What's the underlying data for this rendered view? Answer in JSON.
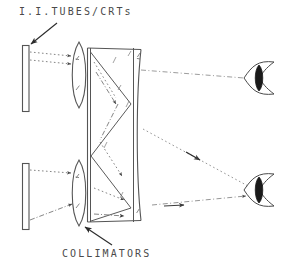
{
  "figure": {
    "title": "I.I.TUBES/CRTs",
    "caption": "COLLIMATORS",
    "width": 294,
    "height": 272,
    "background_color": "#ffffff",
    "ink_color": "#4a4a4a",
    "dark_ink_color": "#2b2b2b"
  },
  "labels": {
    "tubes": "I.I.TUBES/CRTs",
    "collimators": "COLLIMATORS"
  },
  "components": {
    "sources": [
      {
        "name": "upper-ii-tube",
        "x": 22,
        "y": 45,
        "width": 7,
        "height": 67
      },
      {
        "name": "lower-ii-tube",
        "x": 22,
        "y": 163,
        "width": 7,
        "height": 67
      }
    ],
    "collimators": [
      {
        "name": "upper-collimator",
        "cx": 79,
        "cy": 75,
        "rx": 9,
        "ry": 33
      },
      {
        "name": "lower-collimator",
        "cx": 79,
        "cy": 193,
        "rx": 9,
        "ry": 33
      }
    ],
    "prism_block": {
      "name": "beam-combiner-block",
      "left": 87,
      "right": 142,
      "top": 48,
      "bottom": 222
    },
    "eyes": [
      {
        "name": "upper-eye",
        "cx": 262,
        "cy": 78
      },
      {
        "name": "lower-eye",
        "cx": 262,
        "cy": 190
      }
    ]
  },
  "annotations": {
    "tubes_leader": {
      "from_x": 57,
      "from_y": 23,
      "to_x": 29,
      "to_y": 45
    },
    "collimators_leader": {
      "from_x": 112,
      "from_y": 245,
      "to_x": 84,
      "to_y": 228
    }
  }
}
